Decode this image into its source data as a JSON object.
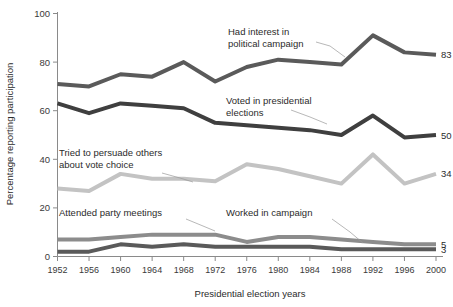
{
  "chart_data": {
    "type": "line",
    "title": "",
    "xlabel": "Presidential election years",
    "ylabel": "Percentage reporting participation",
    "categories": [
      1952,
      1956,
      1960,
      1964,
      1968,
      1972,
      1976,
      1980,
      1984,
      1988,
      1992,
      1996,
      2000
    ],
    "xtick_labels": [
      "1952",
      "1956",
      "1960",
      "1964",
      "1968",
      "1972",
      "1976",
      "1980",
      "1984",
      "1988",
      "1992",
      "1996",
      "2000"
    ],
    "ylim": [
      0,
      100
    ],
    "ytick_labels": [
      "0",
      "20",
      "40",
      "60",
      "80",
      "100"
    ],
    "yticks": [
      0,
      20,
      40,
      60,
      80,
      100
    ],
    "xlim": [
      1952,
      2000
    ],
    "grid": false,
    "legend_position": "inline-annotations",
    "series": [
      {
        "name": "Had interest in political campaign",
        "color": "#5a5a5a",
        "values": [
          71,
          70,
          75,
          74,
          80,
          72,
          78,
          81,
          80,
          79,
          91,
          84,
          83
        ],
        "end_label": "83"
      },
      {
        "name": "Voted in presidential elections",
        "color": "#3f3f3f",
        "values": [
          63,
          59,
          63,
          62,
          61,
          55,
          54,
          53,
          52,
          50,
          58,
          49,
          50
        ],
        "end_label": "50"
      },
      {
        "name": "Tried to persuade others about vote choice",
        "color": "#c3c3c3",
        "values": [
          28,
          27,
          34,
          32,
          32,
          31,
          38,
          36,
          33,
          30,
          42,
          30,
          34
        ],
        "end_label": "34"
      },
      {
        "name": "Attended party meetings",
        "color": "#8c8c8c",
        "values": [
          7,
          7,
          8,
          9,
          9,
          9,
          6,
          8,
          8,
          7,
          6,
          5,
          5
        ],
        "end_label": "5"
      },
      {
        "name": "Worked in campaign",
        "color": "#5a5a5a",
        "values": [
          2,
          2,
          5,
          4,
          5,
          4,
          4,
          4,
          4,
          3,
          3,
          3,
          3
        ],
        "end_label": "3"
      }
    ],
    "annotations": [
      {
        "id": "annot-had-interest",
        "lines": [
          "Had interest in",
          "political campaign"
        ],
        "series": "Had interest in political campaign"
      },
      {
        "id": "annot-voted",
        "lines": [
          "Voted in presidential",
          "elections"
        ],
        "series": "Voted in presidential elections"
      },
      {
        "id": "annot-persuade",
        "lines": [
          "Tried to persuade others",
          "about vote choice"
        ],
        "series": "Tried to persuade others about vote choice"
      },
      {
        "id": "annot-attended",
        "lines": [
          "Attended party meetings"
        ],
        "series": "Attended party meetings"
      },
      {
        "id": "annot-worked",
        "lines": [
          "Worked in campaign"
        ],
        "series": "Worked in campaign"
      }
    ]
  }
}
